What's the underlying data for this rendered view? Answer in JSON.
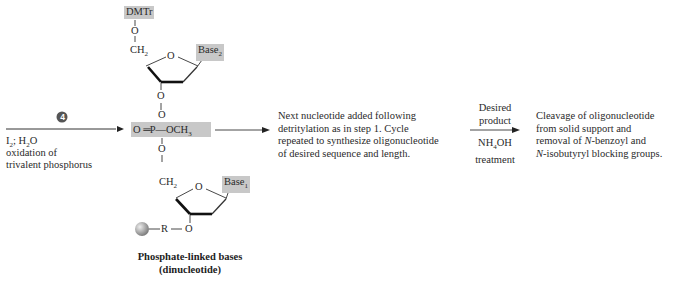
{
  "step": {
    "number": "4",
    "reagent": "I₂; H₂O",
    "reagent_parts": [
      "I",
      "2",
      "; H",
      "2",
      "O"
    ],
    "description_lines": [
      "oxidation of",
      "trivalent phosphorus"
    ]
  },
  "molecule": {
    "top_group": "DMTr",
    "oxygen": "O",
    "ch2": "CH",
    "ch2_sub": "2",
    "base2": "Base",
    "base2_sub": "2",
    "ring_oxygen": "O",
    "phosphate_left": "O",
    "phosphate_center": "P",
    "phosphate_right": "OCH",
    "phosphate_right_sub": "3",
    "base1": "Base",
    "base1_sub": "1",
    "linker_r": "R",
    "caption_line1": "Phosphate-linked bases",
    "caption_line2": "(dinucleotide)"
  },
  "next_step": {
    "lines": [
      "Next nucleotide added following",
      "detritylation as in step 1.  Cycle",
      "repeated to synthesize oligonucleotide",
      "of desired sequence and length."
    ]
  },
  "final_arrow": {
    "above_lines": [
      "Desired",
      "product"
    ],
    "below_reagent": "NH",
    "below_reagent_sub": "4",
    "below_reagent_end": "OH",
    "below_line2": "treatment"
  },
  "result": {
    "lines": [
      "Cleavage of oligonucleotide",
      "from solid support and",
      "removal of N-benzoyl and",
      "N-isobutyryl blocking groups."
    ],
    "line3_prefix": "removal of ",
    "line3_italic": "N",
    "line3_rest": "-benzoyl and",
    "line4_italic": "N",
    "line4_rest": "-isobutyryl blocking groups."
  },
  "colors": {
    "shade": "#c8c8c8",
    "bead": "#9a9a9a",
    "step_badge": "#555555"
  }
}
